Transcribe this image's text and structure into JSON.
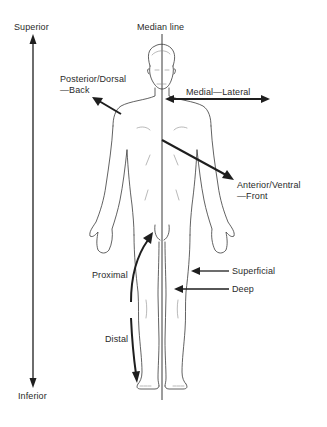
{
  "diagram": {
    "colors": {
      "background": "#ffffff",
      "ink": "#1e1e1e",
      "outline": "#3a3a3a"
    },
    "labels": {
      "superior": "Superior",
      "inferior": "Inferior",
      "median_line": "Median line",
      "posterior_line1": "Posterior/Dorsal",
      "posterior_line2": "—Back",
      "medial_lateral": "Medial—Lateral",
      "anterior_line1": "Anterior/Ventral",
      "anterior_line2": "—Front",
      "proximal": "Proximal",
      "distal": "Distal",
      "superficial": "Superficial",
      "deep": "Deep"
    },
    "arrows": [
      {
        "name": "superior-inferior",
        "direction": "vertical, double-headed"
      },
      {
        "name": "posterior-dorsal",
        "direction": "up-left"
      },
      {
        "name": "medial-lateral",
        "direction": "horizontal, double-headed"
      },
      {
        "name": "anterior-ventral",
        "direction": "down-right"
      },
      {
        "name": "proximal",
        "direction": "curved upward"
      },
      {
        "name": "distal",
        "direction": "downward"
      },
      {
        "name": "superficial",
        "direction": "left"
      },
      {
        "name": "deep",
        "direction": "left"
      }
    ]
  }
}
